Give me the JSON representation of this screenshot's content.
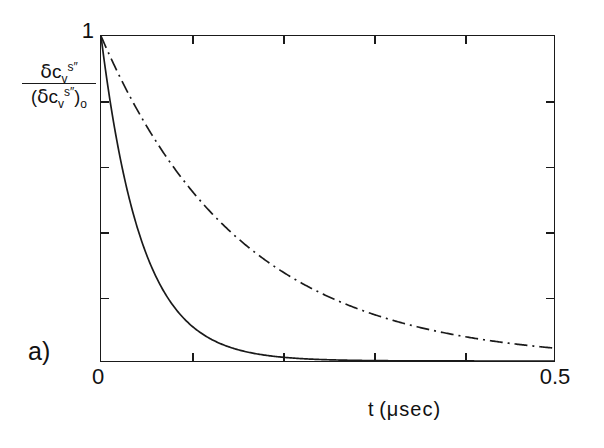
{
  "panel": {
    "label": "a)"
  },
  "axes": {
    "y_tick_top_label": "1",
    "x_tick_min_label": "0",
    "x_tick_max_label": "0.5",
    "x_title_var": "t",
    "x_title_units": "(μsec)",
    "y_title_numerator": {
      "delta": "δ",
      "var": "c",
      "sub": "v",
      "sup": "s″"
    },
    "y_title_denominator": {
      "open": "(",
      "delta": "δ",
      "var": "c",
      "sub": "v",
      "sup": "s″",
      "close": ")",
      "outer_sub": "o"
    }
  },
  "style": {
    "frame_color": "#1a1a1a",
    "curve_color": "#1a1a1a",
    "background": "#ffffff"
  },
  "chart_data": {
    "type": "line",
    "title": "",
    "subtitle": "a)",
    "xlabel": "t (μsec)",
    "ylabel": "δc_v^s″ / (δc_v^s″)_o",
    "xlim": [
      0,
      0.5
    ],
    "ylim": [
      0,
      1
    ],
    "grid": false,
    "legend": null,
    "x_ticks": [
      0,
      0.1,
      0.2,
      0.3,
      0.4,
      0.5
    ],
    "x_tick_labels": [
      "0",
      "",
      "",
      "",
      "",
      "0.5"
    ],
    "y_ticks": [
      0,
      0.2,
      0.4,
      0.6,
      0.8,
      1
    ],
    "y_tick_labels": [
      "",
      "",
      "",
      "",
      "",
      "1"
    ],
    "x": [
      0,
      0.0125,
      0.025,
      0.0375,
      0.05,
      0.0625,
      0.075,
      0.0875,
      0.1,
      0.125,
      0.15,
      0.175,
      0.2,
      0.225,
      0.25,
      0.275,
      0.3,
      0.325,
      0.35,
      0.375,
      0.4,
      0.425,
      0.45,
      0.475,
      0.5
    ],
    "series": [
      {
        "name": "fast decay",
        "linestyle": "solid",
        "color": "#1a1a1a",
        "decay_constant_usec": 0.045,
        "values": [
          1.0,
          0.757,
          0.574,
          0.434,
          0.329,
          0.249,
          0.189,
          0.143,
          0.108,
          0.062,
          0.036,
          0.021,
          0.012,
          0.007,
          0.004,
          0.002,
          0.001,
          0.001,
          0.0,
          0.0,
          0.0,
          0.0,
          0.0,
          0.0,
          0.0
        ]
      },
      {
        "name": "slow decay",
        "linestyle": "dash-dot",
        "color": "#1a1a1a",
        "decay_constant_usec": 0.155,
        "values": [
          1.0,
          0.923,
          0.851,
          0.785,
          0.724,
          0.668,
          0.616,
          0.568,
          0.524,
          0.446,
          0.379,
          0.323,
          0.275,
          0.234,
          0.199,
          0.169,
          0.144,
          0.123,
          0.104,
          0.089,
          0.076,
          0.064,
          0.055,
          0.047,
          0.04
        ]
      }
    ]
  }
}
